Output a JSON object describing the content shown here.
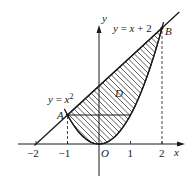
{
  "diagram": {
    "curves": {
      "parabola": {
        "label": "y = x",
        "exponent": "2",
        "equation": "y = x^2"
      },
      "line": {
        "label": "y = x + 2",
        "equation": "y = x + 2"
      }
    },
    "points": {
      "A": {
        "label": "A",
        "x": -1,
        "y": 1
      },
      "B": {
        "label": "B",
        "x": 2,
        "y": 4
      },
      "O": {
        "label": "O",
        "x": 0,
        "y": 0
      }
    },
    "region_label": "D",
    "axes": {
      "x_label": "x",
      "y_label": "y",
      "x_ticks": [
        "−2",
        "−1",
        "1",
        "2"
      ],
      "x_tick_values": [
        -2,
        -1,
        1,
        2
      ]
    },
    "horizontal_segment": {
      "from_x": -1,
      "to_x": 1,
      "y": 1
    },
    "dashed_guides": [
      {
        "x": -1,
        "from_y": 0,
        "to_y": 1
      },
      {
        "x": 2,
        "from_y": 0,
        "to_y": 4
      }
    ],
    "colors": {
      "ink": "#1a1a1a",
      "background": "#ffffff"
    }
  }
}
